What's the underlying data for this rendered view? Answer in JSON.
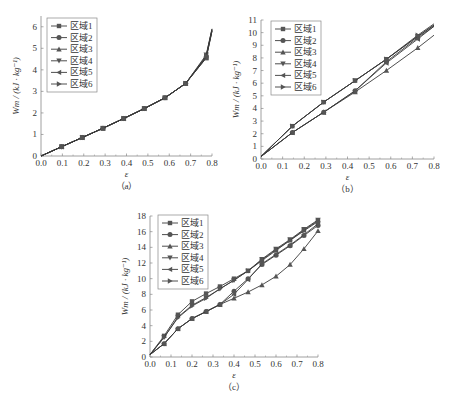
{
  "chart_data": [
    {
      "id": "a",
      "type": "line",
      "caption": "（a）",
      "xlabel": "ε",
      "ylabel": "Wm / (kJ · kg⁻¹)",
      "xlim": [
        0,
        0.8
      ],
      "ylim": [
        0,
        6.5
      ],
      "xticks": [
        0.0,
        0.1,
        0.2,
        0.3,
        0.4,
        0.5,
        0.6,
        0.7,
        0.8
      ],
      "yticks": [
        0,
        1,
        2,
        3,
        4,
        5,
        6
      ],
      "legend": [
        "区域1",
        "区域2",
        "区域3",
        "区域4",
        "区域5",
        "区域6"
      ],
      "legend_position": "upper left",
      "series": [
        {
          "name": "区域1",
          "marker": "square",
          "x": [
            0,
            0.097,
            0.193,
            0.29,
            0.387,
            0.483,
            0.58,
            0.677,
            0.773,
            0.8
          ],
          "y": [
            0,
            0.43,
            0.86,
            1.29,
            1.74,
            2.2,
            2.7,
            3.37,
            4.55,
            5.8
          ]
        },
        {
          "name": "区域2",
          "marker": "circle",
          "x": [
            0,
            0.097,
            0.193,
            0.29,
            0.387,
            0.483,
            0.58,
            0.677,
            0.773,
            0.8
          ],
          "y": [
            0,
            0.43,
            0.86,
            1.29,
            1.74,
            2.2,
            2.7,
            3.37,
            4.6,
            5.85
          ]
        },
        {
          "name": "区域3",
          "marker": "triangle-up",
          "x": [
            0,
            0.097,
            0.193,
            0.29,
            0.387,
            0.483,
            0.58,
            0.677,
            0.773,
            0.8
          ],
          "y": [
            0,
            0.43,
            0.86,
            1.29,
            1.74,
            2.2,
            2.7,
            3.37,
            4.55,
            5.8
          ]
        },
        {
          "name": "区域4",
          "marker": "triangle-down",
          "x": [
            0,
            0.097,
            0.193,
            0.29,
            0.387,
            0.483,
            0.58,
            0.677,
            0.773,
            0.8
          ],
          "y": [
            0,
            0.43,
            0.86,
            1.29,
            1.74,
            2.2,
            2.7,
            3.37,
            4.7,
            5.9
          ]
        },
        {
          "name": "区域5",
          "marker": "triangle-left",
          "x": [
            0,
            0.097,
            0.193,
            0.29,
            0.387,
            0.483,
            0.58,
            0.677,
            0.773,
            0.8
          ],
          "y": [
            0,
            0.43,
            0.86,
            1.29,
            1.74,
            2.2,
            2.7,
            3.37,
            4.6,
            5.85
          ]
        },
        {
          "name": "区域6",
          "marker": "triangle-right",
          "x": [
            0,
            0.097,
            0.193,
            0.29,
            0.387,
            0.483,
            0.58,
            0.677,
            0.773,
            0.8
          ],
          "y": [
            0,
            0.43,
            0.86,
            1.29,
            1.74,
            2.2,
            2.7,
            3.37,
            4.65,
            5.9
          ]
        }
      ]
    },
    {
      "id": "b",
      "type": "line",
      "caption": "（b）",
      "xlabel": "ε",
      "ylabel": "Wm / (kJ · kg⁻¹)",
      "xlim": [
        0,
        0.8
      ],
      "ylim": [
        0,
        11
      ],
      "xticks": [
        0.0,
        0.1,
        0.2,
        0.3,
        0.4,
        0.5,
        0.6,
        0.7,
        0.8
      ],
      "yticks": [
        0,
        1,
        2,
        3,
        4,
        5,
        6,
        7,
        8,
        9,
        10,
        11
      ],
      "legend": [
        "区域1",
        "区域2",
        "区域3",
        "区域4",
        "区域5",
        "区域6"
      ],
      "legend_position": "upper left",
      "series": [
        {
          "name": "区域1",
          "marker": "square",
          "x": [
            0,
            0.145,
            0.29,
            0.435,
            0.58,
            0.725,
            0.8
          ],
          "y": [
            0.2,
            2.6,
            4.5,
            6.2,
            7.9,
            9.7,
            10.6
          ]
        },
        {
          "name": "区域2",
          "marker": "circle",
          "x": [
            0,
            0.145,
            0.29,
            0.435,
            0.58,
            0.725,
            0.8
          ],
          "y": [
            0.2,
            2.1,
            3.7,
            5.4,
            7.7,
            9.6,
            10.5
          ]
        },
        {
          "name": "区域3",
          "marker": "triangle-up",
          "x": [
            0,
            0.145,
            0.29,
            0.435,
            0.58,
            0.725,
            0.8
          ],
          "y": [
            0.2,
            2.1,
            3.7,
            5.3,
            7.0,
            8.8,
            9.8
          ]
        },
        {
          "name": "区域4",
          "marker": "triangle-down",
          "x": [
            0,
            0.145,
            0.29,
            0.435,
            0.58,
            0.725,
            0.8
          ],
          "y": [
            0.2,
            2.6,
            4.5,
            6.2,
            7.9,
            9.7,
            10.6
          ]
        },
        {
          "name": "区域5",
          "marker": "triangle-left",
          "x": [
            0,
            0.145,
            0.29,
            0.435,
            0.58,
            0.725,
            0.8
          ],
          "y": [
            0.2,
            2.1,
            3.7,
            5.4,
            7.6,
            9.5,
            10.5
          ]
        },
        {
          "name": "区域6",
          "marker": "triangle-right",
          "x": [
            0,
            0.145,
            0.29,
            0.435,
            0.58,
            0.725,
            0.8
          ],
          "y": [
            0.2,
            2.6,
            4.5,
            6.2,
            7.9,
            9.8,
            10.7
          ]
        }
      ]
    },
    {
      "id": "c",
      "type": "line",
      "caption": "（c）",
      "xlabel": "ε",
      "ylabel": "Wm / (kJ · kg⁻¹)",
      "xlim": [
        0,
        0.8
      ],
      "ylim": [
        0,
        18
      ],
      "xticks": [
        0.0,
        0.1,
        0.2,
        0.3,
        0.4,
        0.5,
        0.6,
        0.7,
        0.8
      ],
      "yticks": [
        0,
        2,
        4,
        6,
        8,
        10,
        12,
        14,
        16,
        18
      ],
      "legend": [
        "区域1",
        "区域2",
        "区域3",
        "区域4",
        "区域5",
        "区域6"
      ],
      "legend_position": "upper left",
      "series": [
        {
          "name": "区域1",
          "marker": "square",
          "x": [
            0,
            0.067,
            0.133,
            0.2,
            0.267,
            0.333,
            0.4,
            0.467,
            0.533,
            0.6,
            0.667,
            0.733,
            0.8
          ],
          "y": [
            0.3,
            2.7,
            5.4,
            7.1,
            8.1,
            9.0,
            10.0,
            11.0,
            12.3,
            13.6,
            14.9,
            16.2,
            17.4
          ]
        },
        {
          "name": "区域2",
          "marker": "circle",
          "x": [
            0,
            0.067,
            0.133,
            0.2,
            0.267,
            0.333,
            0.4,
            0.467,
            0.533,
            0.6,
            0.667,
            0.733,
            0.8
          ],
          "y": [
            0.3,
            1.7,
            3.6,
            4.9,
            5.8,
            6.7,
            8.4,
            10.0,
            11.8,
            13.0,
            14.2,
            15.5,
            16.8
          ]
        },
        {
          "name": "区域3",
          "marker": "triangle-up",
          "x": [
            0,
            0.067,
            0.133,
            0.2,
            0.267,
            0.333,
            0.4,
            0.467,
            0.533,
            0.6,
            0.667,
            0.733,
            0.8
          ],
          "y": [
            0.3,
            1.7,
            3.6,
            4.9,
            5.8,
            6.7,
            7.5,
            8.3,
            9.2,
            10.3,
            11.8,
            13.8,
            16.1
          ]
        },
        {
          "name": "区域4",
          "marker": "triangle-down",
          "x": [
            0,
            0.067,
            0.133,
            0.2,
            0.267,
            0.333,
            0.4,
            0.467,
            0.533,
            0.6,
            0.667,
            0.733,
            0.8
          ],
          "y": [
            0.3,
            2.5,
            5.1,
            6.6,
            7.6,
            8.7,
            9.8,
            11.0,
            12.5,
            13.8,
            15.0,
            16.3,
            17.5
          ]
        },
        {
          "name": "区域5",
          "marker": "triangle-left",
          "x": [
            0,
            0.067,
            0.133,
            0.2,
            0.267,
            0.333,
            0.4,
            0.467,
            0.533,
            0.6,
            0.667,
            0.733,
            0.8
          ],
          "y": [
            0.3,
            1.7,
            3.6,
            4.9,
            5.8,
            6.7,
            8.0,
            9.9,
            11.9,
            13.1,
            14.3,
            15.6,
            17.0
          ]
        },
        {
          "name": "区域6",
          "marker": "triangle-right",
          "x": [
            0,
            0.067,
            0.133,
            0.2,
            0.267,
            0.333,
            0.4,
            0.467,
            0.533,
            0.6,
            0.667,
            0.733,
            0.8
          ],
          "y": [
            0.3,
            2.5,
            5.0,
            6.5,
            7.5,
            8.7,
            9.8,
            11.0,
            12.4,
            13.7,
            14.9,
            16.1,
            17.3
          ]
        }
      ]
    }
  ],
  "layout": {
    "panels": [
      {
        "x0": 41,
        "x1": 212,
        "y0": 156,
        "y1": 16,
        "legend": [
          47,
          18
        ]
      },
      {
        "x0": 261,
        "x1": 434,
        "y0": 159,
        "y1": 20,
        "legend": [
          271,
          21
        ]
      },
      {
        "x0": 150,
        "x1": 318,
        "y0": 357,
        "y1": 216,
        "legend": [
          158,
          215
        ]
      }
    ],
    "series_color": "#3a3a3a",
    "marker_color": "#555555"
  }
}
